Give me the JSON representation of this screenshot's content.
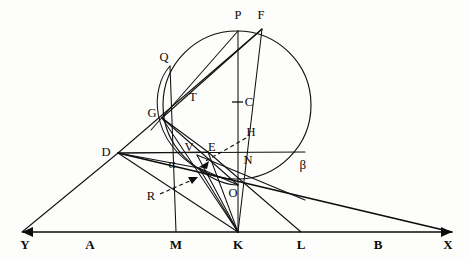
{
  "figure": {
    "width": 470,
    "height": 258,
    "background_color": "#fdfdfb",
    "ink_color": "#101010"
  },
  "circle": {
    "name": "main-circle",
    "center_label": "C",
    "center": {
      "x": 237,
      "y": 105
    },
    "radius": 74
  },
  "baseline": {
    "name": "baseline-YX",
    "y": 232,
    "from_label": "Y",
    "to_label": "X",
    "arrowheads": "both"
  },
  "point_labels": [
    {
      "id": "P",
      "text": "P",
      "x": 238,
      "y": 15,
      "kind": "upper"
    },
    {
      "id": "F",
      "text": "F",
      "x": 261,
      "y": 15,
      "kind": "upper"
    },
    {
      "id": "Q",
      "text": "Q",
      "x": 164,
      "y": 57,
      "kind": "upper"
    },
    {
      "id": "T",
      "text": "T",
      "x": 193,
      "y": 97,
      "kind": "upper"
    },
    {
      "id": "C",
      "text": "C",
      "x": 249,
      "y": 102,
      "kind": "center"
    },
    {
      "id": "G",
      "text": "G",
      "x": 152,
      "y": 113,
      "kind": "upper"
    },
    {
      "id": "H",
      "text": "H",
      "x": 251,
      "y": 132,
      "kind": "upper"
    },
    {
      "id": "D",
      "text": "D",
      "x": 106,
      "y": 152,
      "kind": "left"
    },
    {
      "id": "V",
      "text": "V",
      "x": 189,
      "y": 147,
      "kind": "inner"
    },
    {
      "id": "E",
      "text": "E",
      "x": 212,
      "y": 147,
      "kind": "inner"
    },
    {
      "id": "N",
      "text": "N",
      "x": 248,
      "y": 160,
      "kind": "inner"
    },
    {
      "id": "alpha",
      "text": "α",
      "x": 172,
      "y": 163,
      "kind": "greek"
    },
    {
      "id": "beta",
      "text": "β",
      "x": 303,
      "y": 164,
      "kind": "greek"
    },
    {
      "id": "O",
      "text": "O",
      "x": 233,
      "y": 193,
      "kind": "inner"
    },
    {
      "id": "R",
      "text": "R",
      "x": 151,
      "y": 196,
      "kind": "inner"
    }
  ],
  "axis_labels": [
    {
      "id": "Y",
      "text": "Y",
      "x": 25,
      "y": 244
    },
    {
      "id": "A",
      "text": "A",
      "x": 90,
      "y": 244
    },
    {
      "id": "M",
      "text": "M",
      "x": 176,
      "y": 244
    },
    {
      "id": "K",
      "text": "K",
      "x": 238,
      "y": 244
    },
    {
      "id": "L",
      "text": "L",
      "x": 301,
      "y": 244
    },
    {
      "id": "B",
      "text": "B",
      "x": 378,
      "y": 244
    },
    {
      "id": "X",
      "text": "X",
      "x": 448,
      "y": 244
    }
  ],
  "vertices": {
    "P": {
      "x": 238,
      "y": 31
    },
    "F": {
      "x": 262,
      "y": 29
    },
    "Q": {
      "x": 170,
      "y": 66
    },
    "T": {
      "x": 186,
      "y": 104
    },
    "C": {
      "x": 237,
      "y": 103
    },
    "G": {
      "x": 162,
      "y": 118
    },
    "D": {
      "x": 118,
      "y": 153
    },
    "V": {
      "x": 197,
      "y": 155
    },
    "E": {
      "x": 208,
      "y": 152
    },
    "N": {
      "x": 238,
      "y": 152
    },
    "O": {
      "x": 238,
      "y": 185
    },
    "Rp": {
      "x": 196,
      "y": 176
    },
    "S": {
      "x": 199,
      "y": 168
    },
    "Y": {
      "x": 22,
      "y": 232
    },
    "A": {
      "x": 90,
      "y": 232
    },
    "M": {
      "x": 176,
      "y": 232
    },
    "K": {
      "x": 238,
      "y": 232
    },
    "L": {
      "x": 301,
      "y": 232
    },
    "B": {
      "x": 378,
      "y": 232
    },
    "X": {
      "x": 452,
      "y": 232
    }
  },
  "segments": [
    {
      "name": "segment-D-Y",
      "weight": "normal"
    },
    {
      "name": "segment-D-Q-P-F",
      "weight": "normal"
    },
    {
      "name": "segment-D-N",
      "weight": "normal"
    },
    {
      "name": "segment-D-K",
      "weight": "normal"
    },
    {
      "name": "segment-D-O-X",
      "weight": "heavy"
    },
    {
      "name": "segment-P-K-vertical",
      "weight": "normal"
    },
    {
      "name": "segment-F-G",
      "weight": "normal"
    },
    {
      "name": "segment-F-V-K",
      "weight": "normal"
    },
    {
      "name": "segment-G-E",
      "weight": "normal"
    },
    {
      "name": "segment-G-K",
      "weight": "normal"
    },
    {
      "name": "segment-G-O",
      "weight": "normal"
    },
    {
      "name": "segment-Q-M",
      "weight": "normal"
    },
    {
      "name": "segment-T-chord",
      "weight": "normal"
    },
    {
      "name": "segment-E-L",
      "weight": "normal"
    },
    {
      "name": "segment-E-K",
      "weight": "normal"
    },
    {
      "name": "segment-O-chord",
      "weight": "normal"
    }
  ],
  "dashed_pointers": [
    {
      "name": "pointer-H",
      "from_label": "H",
      "to_point": "S"
    },
    {
      "name": "pointer-R",
      "from_label": "R",
      "to_point": "Rp"
    }
  ]
}
